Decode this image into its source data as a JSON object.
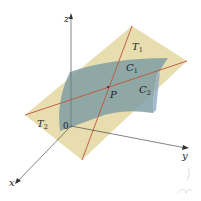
{
  "diagram": {
    "colors": {
      "plane": "#e6d9a6",
      "surface": "#7f9ea3",
      "surface_edge": "#8ea8c2",
      "tangent_lines": "#c0553a",
      "axes": "#333333",
      "handwriting": "#c8c8c8"
    },
    "axes": {
      "x": {
        "label": "x"
      },
      "y": {
        "label": "y"
      },
      "z": {
        "label": "z"
      },
      "origin": {
        "label": "0"
      }
    },
    "labels": {
      "T1": {
        "main": "T",
        "sub": "1"
      },
      "T2": {
        "main": "T",
        "sub": "2"
      },
      "C1": {
        "main": "C",
        "sub": "1"
      },
      "C2": {
        "main": "C",
        "sub": "2"
      },
      "P": {
        "main": "P"
      }
    }
  }
}
